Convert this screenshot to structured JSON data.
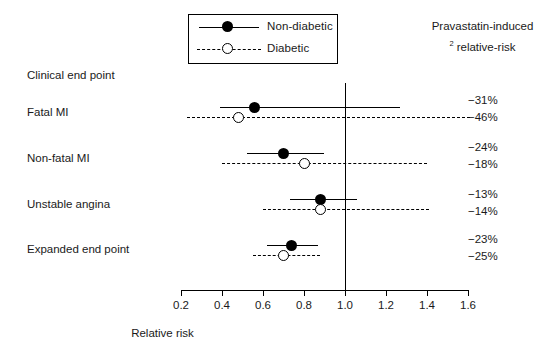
{
  "legend": {
    "items": [
      {
        "label": "Non-diabetic",
        "marker": "filled-circle",
        "line": "solid"
      },
      {
        "label": "Diabetic",
        "marker": "open-circle",
        "line": "dashed"
      }
    ]
  },
  "right_header": {
    "line1": "Pravastatin-induced",
    "superscript": "2",
    "line2": "relative-risk"
  },
  "column_header": "Clinical end point",
  "axis": {
    "title": "Relative risk",
    "ticks": [
      "0.2",
      "0.4",
      "0.6",
      "0.8",
      "1.0",
      "1.2",
      "1.4",
      "1.6"
    ],
    "reference_value": "1.0"
  },
  "rows": [
    {
      "label": "Fatal MI",
      "non_diabetic": {
        "pct": "−31%",
        "rr": 0.56,
        "low": 0.39,
        "high": 1.27
      },
      "diabetic": {
        "pct": "−46%",
        "rr": 0.48,
        "low": 0.23,
        "high": 1.62
      }
    },
    {
      "label": "Non-fatal MI",
      "non_diabetic": {
        "pct": "−24%",
        "rr": 0.7,
        "low": 0.52,
        "high": 0.9
      },
      "diabetic": {
        "pct": "−18%",
        "rr": 0.8,
        "low": 0.4,
        "high": 1.4
      }
    },
    {
      "label": "Unstable angina",
      "non_diabetic": {
        "pct": "−13%",
        "rr": 0.88,
        "low": 0.73,
        "high": 1.06
      },
      "diabetic": {
        "pct": "−14%",
        "rr": 0.88,
        "low": 0.6,
        "high": 1.41
      }
    },
    {
      "label": "Expanded end point",
      "non_diabetic": {
        "pct": "−23%",
        "rr": 0.74,
        "low": 0.62,
        "high": 0.87
      },
      "diabetic": {
        "pct": "−25%",
        "rr": 0.7,
        "low": 0.55,
        "high": 0.88
      }
    }
  ],
  "chart_data": {
    "type": "scatter",
    "title": "",
    "xlabel": "Relative risk",
    "ylabel": "Clinical end point",
    "xlim": [
      0.2,
      1.6
    ],
    "xticks": [
      0.2,
      0.4,
      0.6,
      0.8,
      1.0,
      1.2,
      1.4,
      1.6
    ],
    "grid": false,
    "reference_line_x": 1.0,
    "legend_position": "top-center",
    "categories": [
      "Fatal MI",
      "Non-fatal MI",
      "Unstable angina",
      "Expanded end point"
    ],
    "series": [
      {
        "name": "Non-diabetic",
        "marker": "filled-circle",
        "line": "solid",
        "values": [
          0.56,
          0.7,
          0.88,
          0.74
        ],
        "ci_low": [
          0.39,
          0.52,
          0.73,
          0.62
        ],
        "ci_high": [
          1.27,
          0.9,
          1.06,
          0.87
        ],
        "labels": [
          "−31%",
          "−24%",
          "−13%",
          "−23%"
        ]
      },
      {
        "name": "Diabetic",
        "marker": "open-circle",
        "line": "dashed",
        "values": [
          0.48,
          0.8,
          0.88,
          0.7
        ],
        "ci_low": [
          0.23,
          0.4,
          0.6,
          0.55
        ],
        "ci_high": [
          1.62,
          1.4,
          1.41,
          0.88
        ],
        "labels": [
          "−46%",
          "−18%",
          "−14%",
          "−25%"
        ]
      }
    ],
    "annotations": [
      "Pravastatin-induced relative-risk"
    ]
  },
  "colors": {
    "ink": "#000000",
    "background": "#ffffff"
  }
}
